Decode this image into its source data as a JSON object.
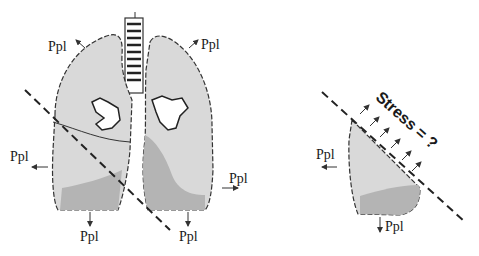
{
  "diagram": {
    "left_panel": {
      "description": "Whole lungs with oblique dashed cutting plane",
      "labels": [
        {
          "id": "upper-left",
          "text": "Ppl"
        },
        {
          "id": "upper-right",
          "text": "Ppl"
        },
        {
          "id": "mid-left",
          "text": "Ppl"
        },
        {
          "id": "mid-right",
          "text": "Ppl"
        },
        {
          "id": "bottom-left",
          "text": "Ppl"
        },
        {
          "id": "bottom-right",
          "text": "Ppl"
        }
      ]
    },
    "right_panel": {
      "description": "Isolated lung segment cut along the dashed plane",
      "labels": [
        {
          "id": "left",
          "text": "Ppl"
        },
        {
          "id": "bottom",
          "text": "Ppl"
        }
      ],
      "stress_label": "Stress = ?"
    },
    "colors": {
      "lung_light": "#d9d9d9",
      "lung_dark": "#b4b4b4",
      "outline": "#333333",
      "text": "#1a1a1a"
    }
  }
}
